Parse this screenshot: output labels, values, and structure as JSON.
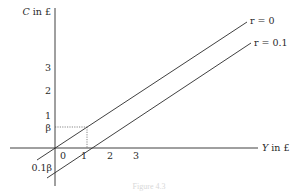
{
  "diagram": {
    "y_axis_label": "C in £",
    "x_axis_label": "Y in £",
    "y_ticks": [
      "3",
      "2",
      "1"
    ],
    "beta_label": "β",
    "x_ticks": [
      "0",
      "1",
      "2",
      "3"
    ],
    "intercept_label": "0.1β",
    "lines": [
      {
        "label": "r = 0"
      },
      {
        "label": "r = 0.1"
      }
    ],
    "caption": "Figure 4.3"
  },
  "colors": {
    "ink": "#2a2a2a",
    "background": "#ffffff"
  }
}
